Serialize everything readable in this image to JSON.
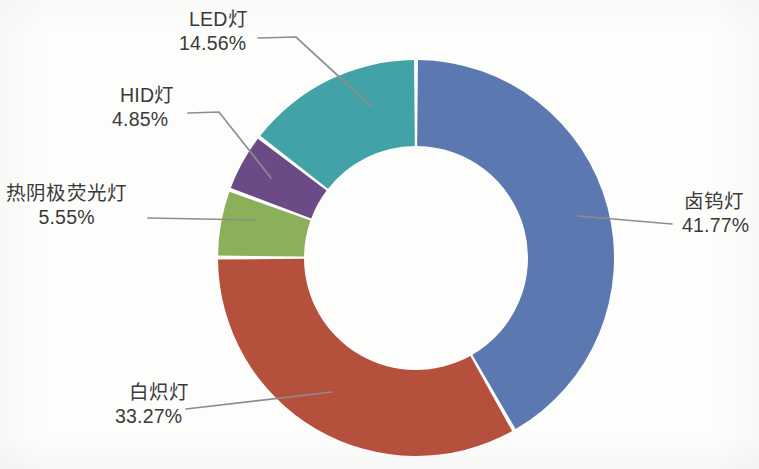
{
  "chart_data": {
    "type": "pie",
    "variant": "donut",
    "title": "",
    "subtitle": "",
    "xlabel": "",
    "ylabel": "",
    "legend": "none",
    "grid": false,
    "units": "percent",
    "labels_show_name_and_percent": true,
    "start_angle_deg": 0,
    "direction": "clockwise",
    "categories": [
      "卤钨灯",
      "白炽灯",
      "热阴极荧光灯",
      "HID灯",
      "LED灯"
    ],
    "values": [
      41.77,
      33.27,
      5.55,
      4.85,
      14.56
    ],
    "percent_labels": [
      "41.77%",
      "33.27%",
      "5.55%",
      "4.85%",
      "14.56%"
    ],
    "colors": [
      "#5B79B0",
      "#B4503C",
      "#8CB05A",
      "#6B4B85",
      "#41A3A8"
    ],
    "slices": [
      {
        "name": "卤钨灯",
        "value": 41.77,
        "percent_label": "41.77%",
        "color": "#5B79B0",
        "label_position": "right"
      },
      {
        "name": "白炽灯",
        "value": 33.27,
        "percent_label": "33.27%",
        "color": "#B4503C",
        "label_position": "bottom-left"
      },
      {
        "name": "热阴极荧光灯",
        "value": 5.55,
        "percent_label": "5.55%",
        "color": "#8CB05A",
        "label_position": "left"
      },
      {
        "name": "HID灯",
        "value": 4.85,
        "percent_label": "4.85%",
        "color": "#6B4B85",
        "label_position": "upper-left"
      },
      {
        "name": "LED灯",
        "value": 14.56,
        "percent_label": "14.56%",
        "color": "#41A3A8",
        "label_position": "top-left"
      }
    ]
  },
  "style": {
    "background": "#fdfdfb",
    "label_text_color": "#3a3a3a",
    "leader_line_color": "#8d8d8d",
    "slice_gap_color": "#ffffff"
  }
}
